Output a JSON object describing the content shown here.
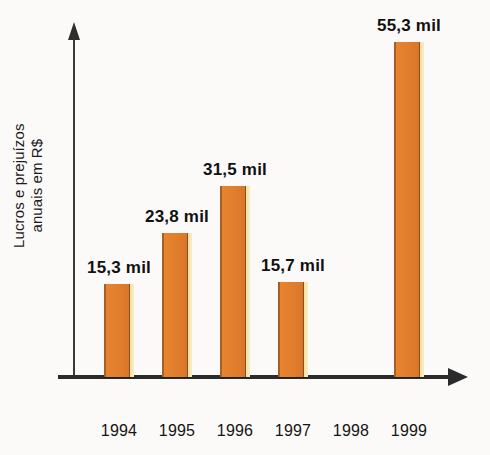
{
  "chart_data": {
    "type": "bar",
    "title": "",
    "subtitle": "",
    "xlabel": "",
    "ylabel": "Lucros e prejuízos\nanuais em R$",
    "categories": [
      "1994",
      "1995",
      "1996",
      "1997",
      "1998",
      "1999"
    ],
    "values": [
      15.3,
      23.8,
      31.5,
      15.7,
      -2.5,
      55.3
    ],
    "value_labels": [
      "15,3 mil",
      "23,8 mil",
      "31,5 mil",
      "15,7 mil",
      "− 2,5 mil",
      "55,3 mil"
    ],
    "units": "mil R$",
    "ylim": [
      -5,
      60
    ],
    "grid": false,
    "legend": null,
    "axis_arrows": true,
    "series": [
      {
        "name": "Lucros e prejuízos anuais em R$",
        "values": [
          15.3,
          23.8,
          31.5,
          15.7,
          -2.5,
          55.3
        ]
      }
    ],
    "colors": {
      "bar_fill": "#e0802e",
      "bar_shadow_edge": "#8a4e1d",
      "bar_highlight_edge": "#f5e2a8",
      "axis": "#2b2b2b",
      "text": "#111111",
      "background": "#fbfaf8"
    }
  },
  "axes": {
    "y_label_line1": "Lucros e prejuízos",
    "y_label_line2": "anuais em R$"
  },
  "bars": [
    {
      "category": "1994",
      "value": 15.3,
      "label": "15,3 mil",
      "sign": "positive"
    },
    {
      "category": "1995",
      "value": 23.8,
      "label": "23,8 mil",
      "sign": "positive"
    },
    {
      "category": "1996",
      "value": 31.5,
      "label": "31,5 mil",
      "sign": "positive"
    },
    {
      "category": "1997",
      "value": 15.7,
      "label": "15,7 mil",
      "sign": "positive"
    },
    {
      "category": "1998",
      "value": -2.5,
      "label": "− 2,5 mil",
      "sign": "negative"
    },
    {
      "category": "1999",
      "value": 55.3,
      "label": "55,3 mil",
      "sign": "positive"
    }
  ]
}
